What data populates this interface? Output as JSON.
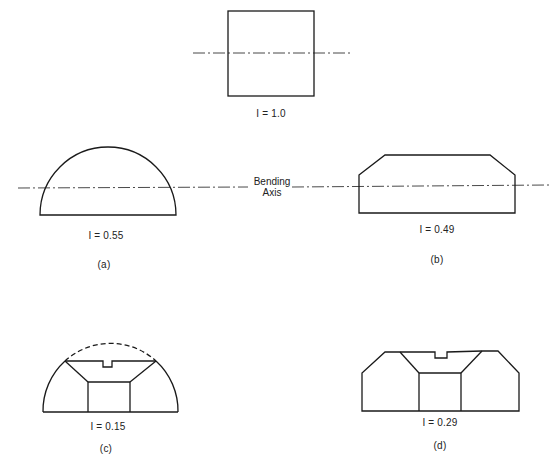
{
  "diagram": {
    "axis_label_line1": "Bending",
    "axis_label_line2": "Axis",
    "figures": [
      {
        "id": "reference",
        "shape": "square",
        "inertia_label": "I = 1.0",
        "caption": ""
      },
      {
        "id": "a",
        "shape": "semicircle",
        "inertia_label": "I = 0.55",
        "caption": "(a)"
      },
      {
        "id": "b",
        "shape": "chamfered rectangle",
        "inertia_label": "I = 0.49",
        "caption": "(b)"
      },
      {
        "id": "c",
        "shape": "semicircle with trapezoidal cutouts",
        "inertia_label": "I = 0.15",
        "caption": "(c)"
      },
      {
        "id": "d",
        "shape": "chamfered rectangle with trapezoidal cutouts",
        "inertia_label": "I = 0.29",
        "caption": "(d)"
      }
    ],
    "colors": {
      "stroke": "#1a1a1a",
      "background": "#ffffff"
    }
  }
}
